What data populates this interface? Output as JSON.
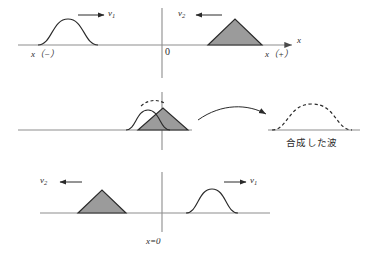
{
  "figure": {
    "title_alt": "wave-superposition-diagram",
    "colors": {
      "baseline": "#8d8d8d",
      "axis": "#8d8d8d",
      "pulse_stroke": "#2a2a2a",
      "triangle_fill": "#9b9b9b",
      "triangle_stroke": "#2a2a2a",
      "dashed": "#2a2a2a",
      "text": "#2b2b2b"
    },
    "panels": {
      "top": {
        "name": "before-collision",
        "axis_label": "x",
        "origin_label": "0",
        "left_region_label": "x（−）",
        "right_region_label": "x（+）",
        "left_pulse": {
          "shape": "gaussian",
          "velocity_label": "v",
          "velocity_sub": "1",
          "direction": "right"
        },
        "right_pulse": {
          "shape": "triangle",
          "velocity_label": "v",
          "velocity_sub": "2",
          "direction": "left"
        }
      },
      "middle": {
        "name": "during-overlap",
        "left_pulse": {
          "shape": "gaussian"
        },
        "right_pulse": {
          "shape": "triangle"
        },
        "resultant": {
          "shape": "dashed-sum"
        },
        "arrow": "curved-arrow-right",
        "result_pulse": {
          "shape": "dashed-hump"
        },
        "caption": "合成した波"
      },
      "bottom": {
        "name": "after-collision",
        "origin_label": "x=0",
        "left_pulse": {
          "shape": "triangle",
          "velocity_label": "v",
          "velocity_sub": "2",
          "direction": "left"
        },
        "right_pulse": {
          "shape": "gaussian",
          "velocity_label": "v",
          "velocity_sub": "1",
          "direction": "right"
        }
      }
    }
  }
}
